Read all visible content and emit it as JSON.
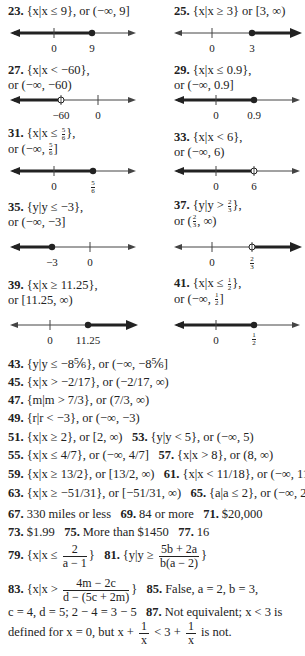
{
  "problems": {
    "p23": {
      "num": "23.",
      "text": "{x|x ≤ 9}, or (−∞, 9]",
      "ticks": [
        "0",
        "9"
      ]
    },
    "p25": {
      "num": "25.",
      "text": "{x|x ≥ 3} or [3, ∞)",
      "ticks": [
        "0",
        "3"
      ]
    },
    "p27": {
      "num": "27.",
      "line1": "{x|x < −60},",
      "line2": "or (−∞, −60)",
      "ticks": [
        "−60",
        "0"
      ]
    },
    "p29": {
      "num": "29.",
      "line1": "{x|x ≤ 0.9},",
      "line2": "or (−∞, 0.9]",
      "ticks": [
        "0",
        "0.9"
      ]
    },
    "p31": {
      "num": "31.",
      "line1a": "{x|x ≤ ",
      "line1b": "},",
      "frac_n": "5",
      "frac_d": "6",
      "line2a": "or (−∞, ",
      "line2b": "]",
      "ticks": [
        "0"
      ]
    },
    "p33": {
      "num": "33.",
      "line1": "{x|x < 6},",
      "line2": "or (−∞, 6)",
      "ticks": [
        "0",
        "6"
      ]
    },
    "p35": {
      "num": "35.",
      "line1": "{y|y ≤ −3},",
      "line2": "or (−∞, −3]",
      "ticks": [
        "−3",
        "0"
      ]
    },
    "p37": {
      "num": "37.",
      "line1a": "{y|y > ",
      "line1b": "},",
      "frac_n": "2",
      "frac_d": "3",
      "line2a": "or (",
      "line2b": ", ∞)",
      "ticks": [
        "0"
      ]
    },
    "p39": {
      "num": "39.",
      "line1": "{x|x ≥ 11.25},",
      "line2": "or [11.25, ∞)",
      "ticks": [
        "0",
        "11.25"
      ]
    },
    "p41": {
      "num": "41.",
      "line1a": "{x|x ≤ ",
      "line1b": "},",
      "frac_n": "1",
      "frac_d": "2",
      "line2a": "or (−∞, ",
      "line2b": "]",
      "ticks": [
        "0"
      ]
    }
  },
  "answers": {
    "a43": {
      "num": "43.",
      "text": "{y|y ≤ −8⅚}, or (−∞, −8⅚]"
    },
    "a45": {
      "num": "45.",
      "text": "{x|x > −2/17}, or (−2/17, ∞)"
    },
    "a47": {
      "num": "47.",
      "text": "{m|m > 7/3}, or (7/3, ∞)"
    },
    "a49": {
      "num": "49.",
      "text": "{r|r < −3}, or (−∞, −3)"
    },
    "a51": {
      "num": "51.",
      "text": "{x|x ≥ 2}, or [2, ∞)"
    },
    "a53": {
      "num": "53.",
      "text": "{y|y < 5}, or (−∞, 5)"
    },
    "a55": {
      "num": "55.",
      "text": "{x|x ≤ 4/7}, or (−∞, 4/7]"
    },
    "a57": {
      "num": "57.",
      "text": "{x|x > 8}, or (8, ∞)"
    },
    "a59": {
      "num": "59.",
      "text": "{x|x ≥ 13/2}, or [13/2, ∞)"
    },
    "a61": {
      "num": "61.",
      "text": "{x|x < 11/18}, or (−∞, 11/18)"
    },
    "a63": {
      "num": "63.",
      "text": "{x|x ≥ −51/31}, or [−51/31, ∞)"
    },
    "a65": {
      "num": "65.",
      "text": "{a|a ≤ 2}, or (−∞, 2]"
    },
    "a67": {
      "num": "67.",
      "text": "330 miles or less"
    },
    "a69": {
      "num": "69.",
      "text": "84 or more"
    },
    "a71": {
      "num": "71.",
      "text": "$20,000"
    },
    "a73": {
      "num": "73.",
      "text": "$1.99"
    },
    "a75": {
      "num": "75.",
      "text": "More than $1450"
    },
    "a77": {
      "num": "77.",
      "text": "16"
    },
    "a79": {
      "num": "79.",
      "pre": "{x|x ≤ ",
      "frac_n": "2",
      "frac_d": "a − 1",
      "post": "}"
    },
    "a81": {
      "num": "81.",
      "pre": "{y|y ≥ ",
      "frac_n": "5b + 2a",
      "frac_d": "b(a − 2)",
      "post": "}"
    },
    "a83": {
      "num": "83.",
      "pre": "{x|x > ",
      "frac_n": "4m − 2c",
      "frac_d": "d − (5c + 2m)",
      "post": "}"
    },
    "a85": {
      "num": "85.",
      "text": "False, a = 2, b = 3,",
      "text2": "c = 4, d = 5; 2 − 4 = 3 − 5"
    },
    "a87": {
      "num": "87.",
      "text": "Not equivalent; x < 3 is",
      "text2a": "defined for x = 0, but x + ",
      "text2b": " < 3 + ",
      "text2c": " is not.",
      "frac_n": "1",
      "frac_d": "x"
    }
  }
}
